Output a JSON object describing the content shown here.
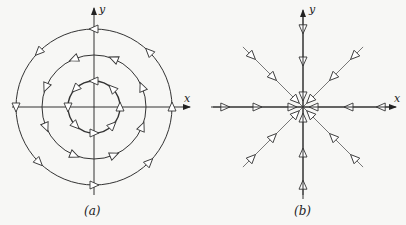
{
  "panels": [
    {
      "id": "a",
      "caption": "(a)",
      "x_label": "x",
      "y_label": "y",
      "description": "Concentric circular trajectories (center) with counterclockwise direction arrows",
      "radii": [
        78,
        52,
        26
      ]
    },
    {
      "id": "b",
      "caption": "(b)",
      "x_label": "x",
      "y_label": "y",
      "description": "Straight-line trajectories converging to origin (stable node/star)",
      "ray_count": 8
    }
  ],
  "colors": {
    "line": "#222222",
    "ray": "#555555",
    "background": "#f7f7f5"
  }
}
